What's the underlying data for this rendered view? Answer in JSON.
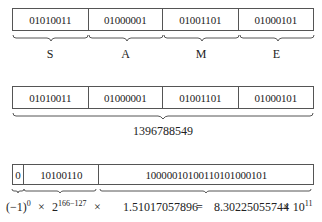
{
  "ascii_row": {
    "bytes": [
      "01010011",
      "01000001",
      "01001101",
      "01000101"
    ],
    "letters": [
      "S",
      "A",
      "M",
      "E"
    ]
  },
  "integer_row": {
    "bytes": [
      "01010011",
      "01000001",
      "01001101",
      "01000101"
    ],
    "value": "1396788549"
  },
  "float_row": {
    "sign_bit": "0",
    "exponent_bits": "10100110",
    "mantissa_bits": "10000010100110101000101",
    "formula": {
      "sign_term": "(−1)",
      "sign_exp": "0",
      "times1": "×",
      "base": "2",
      "exp_term": "166−127",
      "times2": "×",
      "mantissa_value": "1.51017057896",
      "equals": "=",
      "result": "8.30225055744",
      "times3": "× 10",
      "result_exp": "11"
    }
  }
}
